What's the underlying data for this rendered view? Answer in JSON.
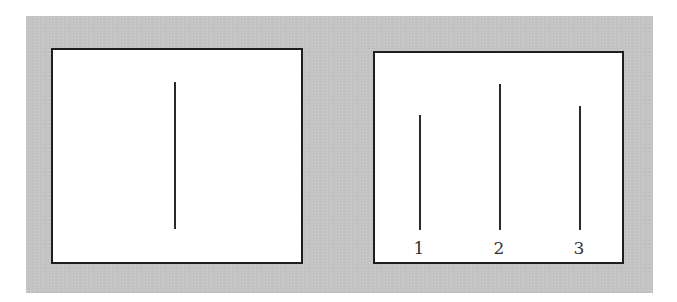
{
  "figure": {
    "background_color": "#c4c4c4",
    "card_color": "#ffffff",
    "line_color": "#2a2a2a",
    "standard_card": {
      "line": {
        "x": 175,
        "top": 82,
        "bottom": 229
      }
    },
    "comparison_card": {
      "lines": [
        {
          "label": "1",
          "x": 420,
          "top": 115,
          "bottom": 230
        },
        {
          "label": "2",
          "x": 500,
          "top": 84,
          "bottom": 230
        },
        {
          "label": "3",
          "x": 580,
          "top": 106,
          "bottom": 230
        }
      ]
    }
  }
}
